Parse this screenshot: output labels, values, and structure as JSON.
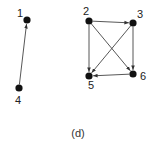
{
  "diagram": {
    "caption": "(d)",
    "colors": {
      "node": "#111111",
      "edge": "#444444",
      "label": "#222222",
      "background": "#ffffff"
    },
    "nodes": [
      {
        "id": "1",
        "label": "1",
        "x": 27,
        "y": 20,
        "label_x": 17,
        "label_y": 17
      },
      {
        "id": "4",
        "label": "4",
        "x": 19,
        "y": 88,
        "label_x": 15,
        "label_y": 104
      },
      {
        "id": "2",
        "label": "2",
        "x": 89,
        "y": 21,
        "label_x": 83,
        "label_y": 15
      },
      {
        "id": "3",
        "label": "3",
        "x": 133,
        "y": 23,
        "label_x": 137,
        "label_y": 18
      },
      {
        "id": "5",
        "label": "5",
        "x": 89,
        "y": 76,
        "label_x": 88,
        "label_y": 89
      },
      {
        "id": "6",
        "label": "6",
        "x": 133,
        "y": 74,
        "label_x": 140,
        "label_y": 80
      }
    ],
    "edges": [
      {
        "from": "4",
        "to": "1"
      },
      {
        "from": "2",
        "to": "3"
      },
      {
        "from": "2",
        "to": "5"
      },
      {
        "from": "2",
        "to": "6"
      },
      {
        "from": "3",
        "to": "5"
      },
      {
        "from": "3",
        "to": "6"
      },
      {
        "from": "6",
        "to": "5"
      }
    ]
  }
}
